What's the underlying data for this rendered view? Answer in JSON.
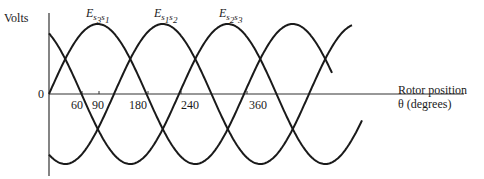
{
  "diagram": {
    "y_axis_label": "Volts",
    "origin_label": "0",
    "x_axis_label_line1": "Rotor position",
    "x_axis_label_line2": "θ (degrees)",
    "x_ticks": [
      "60",
      "90",
      "180",
      "240",
      "360"
    ],
    "curves": [
      {
        "name": "E",
        "sub1": "s3",
        "sub1a": "s",
        "sub1b": "3",
        "sub2a": "s",
        "sub2b": "1",
        "peak_deg": 90
      },
      {
        "name": "E",
        "sub1a": "s",
        "sub1b": "1",
        "sub2a": "s",
        "sub2b": "2",
        "peak_deg": 210
      },
      {
        "name": "E",
        "sub1a": "s",
        "sub1b": "2",
        "sub2a": "s",
        "sub2b": "3",
        "peak_deg": 330
      }
    ],
    "line_color": "#1a1a1a"
  }
}
